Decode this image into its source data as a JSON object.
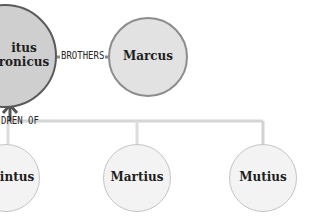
{
  "diagram": {
    "type": "family-tree",
    "nodes": [
      {
        "id": "titus",
        "label_line1": "Titus",
        "label_line2": "Andronicus",
        "visible_line1": "itus",
        "visible_line2": "ronicus"
      },
      {
        "id": "marcus",
        "label": "Marcus"
      },
      {
        "id": "quintus",
        "label": "Quintus",
        "visible": "intus"
      },
      {
        "id": "martius",
        "label": "Martius"
      },
      {
        "id": "mutius",
        "label": "Mutius"
      }
    ],
    "edges": [
      {
        "from": "titus",
        "to": "marcus",
        "label": "BROTHERS"
      },
      {
        "from": "children",
        "to": "titus",
        "label": "DREN OF",
        "full_label": "CHILDREN OF",
        "arrow": "up"
      }
    ],
    "colors": {
      "main_fill": "#cfcfcf",
      "main_border": "#5a5a5a",
      "sibling_fill": "#e2e2e2",
      "child_fill": "#f3f3f3",
      "connector_dark": "#555555",
      "connector_light": "#d0d0d0"
    }
  }
}
